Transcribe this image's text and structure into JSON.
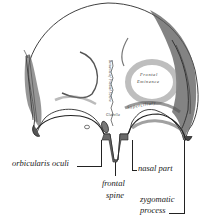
{
  "figure": {
    "style": "engraving",
    "background": "#ffffff",
    "ink": "#1a1a1a"
  },
  "inner_labels": {
    "frontal_eminence_line1": "Frontal",
    "frontal_eminence_line2": "Eminence",
    "superciliary_arch": "Superciliary",
    "metopic_suture": "Remains of Frontal Suture",
    "glabella": "Glabella"
  },
  "callouts": {
    "orbicularis_oculi": "orbicularis oculi",
    "nasal_part": "nasal part",
    "frontal_spine_line1": "frontal",
    "frontal_spine_line2": "spine",
    "zygomatic_process_line1": "zygomatic",
    "zygomatic_process_line2": "process"
  }
}
